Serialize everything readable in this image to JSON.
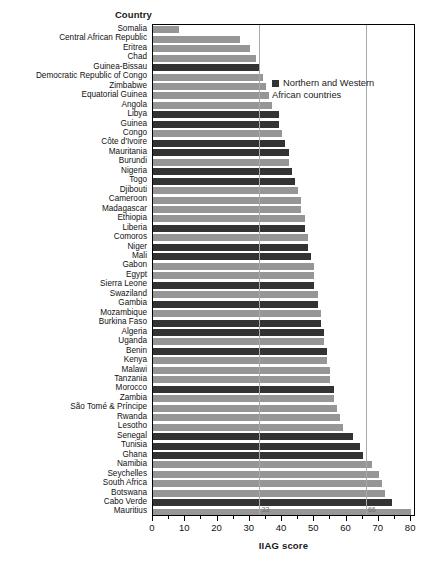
{
  "chart_data": {
    "type": "bar",
    "orientation": "horizontal",
    "title": "",
    "xlabel": "IIAG score",
    "ylabel": "Country",
    "xlim": [
      0,
      81.5
    ],
    "grid": false,
    "xticks": [
      0,
      10,
      20,
      30,
      40,
      50,
      60,
      70,
      80
    ],
    "xtick_labels": [
      "0",
      "10",
      "20",
      "30",
      "40",
      "50",
      "60",
      "70",
      "80"
    ],
    "reference_lines": [
      {
        "value": 33,
        "label": "33"
      },
      {
        "value": 66,
        "label": "66"
      }
    ],
    "legend": {
      "position": "upper-right-inside",
      "entries": [
        {
          "label": "Northern and Western African countries",
          "color": "#333333"
        }
      ]
    },
    "series_colors": {
      "northern_western": "#333333",
      "other": "#969696"
    },
    "categories": [
      "Somalia",
      "Central African Republic",
      "Eritrea",
      "Chad",
      "Guinea-Bissau",
      "Democratic Republic of Congo",
      "Zimbabwe",
      "Equatorial Guinea",
      "Angola",
      "Libya",
      "Guinea",
      "Congo",
      "Côte d'Ivoire",
      "Mauritania",
      "Burundi",
      "Nigeria",
      "Togo",
      "Djibouti",
      "Cameroon",
      "Madagascar",
      "Ethiopia",
      "Liberia",
      "Comoros",
      "Niger",
      "Mali",
      "Gabon",
      "Egypt",
      "Sierra Leone",
      "Swaziland",
      "Gambia",
      "Mozambique",
      "Burkina Faso",
      "Algeria",
      "Uganda",
      "Benin",
      "Kenya",
      "Malawi",
      "Tanzania",
      "Morocco",
      "Zambia",
      "São Tomé & Príncipe",
      "Rwanda",
      "Lesotho",
      "Senegal",
      "Tunisia",
      "Ghana",
      "Namibia",
      "Seychelles",
      "South Africa",
      "Botswana",
      "Cabo Verde",
      "Mauritius"
    ],
    "values": [
      8,
      27,
      30,
      32,
      33,
      34,
      35,
      36,
      37,
      39,
      39,
      40,
      41,
      42,
      42,
      43,
      44,
      45,
      46,
      46,
      47,
      47,
      48,
      48,
      49,
      50,
      50,
      50,
      51,
      51,
      52,
      52,
      53,
      53,
      54,
      54,
      55,
      55,
      56,
      56,
      57,
      58,
      59,
      62,
      64,
      65,
      68,
      70,
      71,
      72,
      74,
      80
    ],
    "groups": [
      "other",
      "other",
      "other",
      "other",
      "northern_western",
      "other",
      "other",
      "other",
      "other",
      "northern_western",
      "northern_western",
      "other",
      "northern_western",
      "northern_western",
      "other",
      "northern_western",
      "northern_western",
      "other",
      "other",
      "other",
      "other",
      "northern_western",
      "other",
      "northern_western",
      "northern_western",
      "other",
      "other",
      "northern_western",
      "other",
      "northern_western",
      "other",
      "northern_western",
      "northern_western",
      "other",
      "northern_western",
      "other",
      "other",
      "other",
      "northern_western",
      "other",
      "other",
      "other",
      "other",
      "northern_western",
      "northern_western",
      "northern_western",
      "other",
      "other",
      "other",
      "other",
      "northern_western",
      "other"
    ]
  }
}
